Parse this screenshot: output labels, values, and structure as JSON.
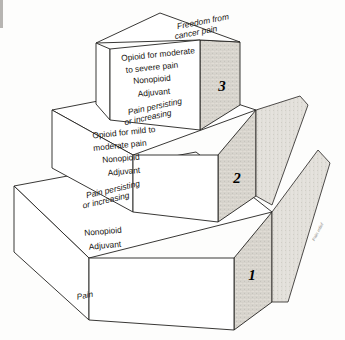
{
  "diagram": {
    "background_color": "#fdfdfc",
    "line_color": "#23211f",
    "shading_color": "#b9b5ad"
  },
  "steps": [
    {
      "number": "1",
      "top_label_line1": "Pain",
      "top_label_line2": "",
      "front_lines": [
        "Nonopioid",
        "Adjuvant"
      ],
      "transition_line1": "Pain persisting",
      "transition_line2": "or increasing"
    },
    {
      "number": "2",
      "front_lines": [
        "Opioid for mild to",
        "moderate pain",
        "Nonopioid",
        "Adjuvant"
      ],
      "transition_line1": "Pain persisting",
      "transition_line2": "or increasing"
    },
    {
      "number": "3",
      "front_lines": [
        "Opioid for moderate",
        "to severe pain",
        "Nonopioid",
        "Adjuvant"
      ],
      "top_line1": "Freedom from",
      "top_line2": "cancer pain"
    }
  ],
  "captions": {
    "base_pain": "Pain",
    "edge_faint": "Pain relief"
  }
}
